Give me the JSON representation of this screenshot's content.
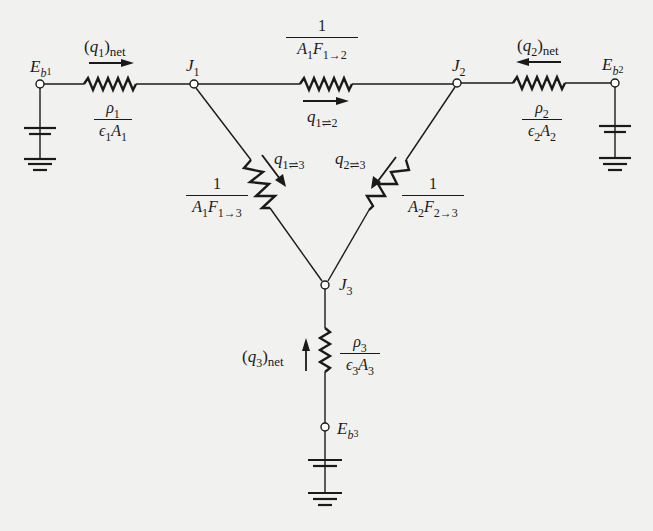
{
  "diagram": {
    "type": "radiation network (three-surface enclosure)",
    "colors": {
      "background": "#f1f1ef",
      "ink": "#1a1a1a"
    },
    "nodes": {
      "Eb1": {
        "label": "E",
        "sub": "b",
        "subsub": "1"
      },
      "Eb2": {
        "label": "E",
        "sub": "b",
        "subsub": "2"
      },
      "Eb3": {
        "label": "E",
        "sub": "b",
        "subsub": "3"
      },
      "J1": {
        "label": "J",
        "sub": "1"
      },
      "J2": {
        "label": "J",
        "sub": "2"
      },
      "J3": {
        "label": "J",
        "sub": "3"
      }
    },
    "surface_resistances": {
      "R1": {
        "num_sym": "ρ",
        "num_sub": "1",
        "den": "ϵ",
        "den_sub": "1",
        "den2": "A",
        "den2_sub": "1"
      },
      "R2": {
        "num_sym": "ρ",
        "num_sub": "2",
        "den": "ϵ",
        "den_sub": "2",
        "den2": "A",
        "den2_sub": "2"
      },
      "R3": {
        "num_sym": "ρ",
        "num_sub": "3",
        "den": "ϵ",
        "den_sub": "3",
        "den2": "A",
        "den2_sub": "3"
      }
    },
    "space_resistances": {
      "R12": {
        "num": "1",
        "A": "A",
        "A_sub": "1",
        "F": "F",
        "F_sub": "1→2"
      },
      "R13": {
        "num": "1",
        "A": "A",
        "A_sub": "1",
        "F": "F",
        "F_sub": "1→3"
      },
      "R23": {
        "num": "1",
        "A": "A",
        "A_sub": "2",
        "F": "F",
        "F_sub": "2→3"
      }
    },
    "flows": {
      "q1net": {
        "q": "q",
        "sub": "1",
        "suffix": "net",
        "open": "(",
        "close": ")"
      },
      "q2net": {
        "q": "q",
        "sub": "2",
        "suffix": "net",
        "open": "(",
        "close": ")"
      },
      "q3net": {
        "q": "q",
        "sub": "3",
        "suffix": "net",
        "open": "(",
        "close": ")"
      },
      "q12": {
        "q": "q",
        "sub": "1⇌2"
      },
      "q13": {
        "q": "q",
        "sub": "1⇌3"
      },
      "q23": {
        "q": "q",
        "sub": "2⇌3"
      }
    }
  }
}
